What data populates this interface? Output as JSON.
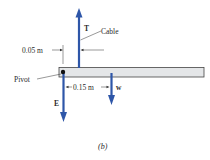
{
  "figure": {
    "caption": "(b)",
    "colors": {
      "force_arrow": "#2e56a8",
      "beam_fill": "#e4e6e8",
      "beam_stroke": "#444444",
      "text": "#2a2a2a",
      "leader": "#333333"
    },
    "beam": {
      "label": "beam"
    },
    "forces": [
      {
        "symbol": "T",
        "direction": "up",
        "description": "Cable tension"
      },
      {
        "symbol": "E",
        "direction": "down",
        "description": "Force at pivot"
      },
      {
        "symbol": "w",
        "direction": "down",
        "description": "Weight"
      }
    ],
    "labels": {
      "cable": "Cable",
      "pivot": "Pivot",
      "dim_cable": "0.05 m",
      "dim_weight": "0.15 m"
    }
  }
}
